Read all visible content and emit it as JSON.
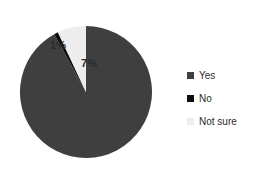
{
  "chart_data": {
    "type": "pie",
    "title": "",
    "subtitle": "",
    "xlabel": "",
    "ylabel": "",
    "grid": false,
    "legend_position": "right",
    "start_angle_deg": 0,
    "direction": "clockwise",
    "categories": [
      "Yes",
      "No",
      "Not sure"
    ],
    "values": [
      92,
      1,
      7
    ],
    "value_unit": "%",
    "data_labels": [
      "92%",
      "1%",
      "7%"
    ],
    "colors": [
      "#3f3f3f",
      "#0d0d0d",
      "#ededed"
    ],
    "slices": [
      {
        "label": "Yes",
        "value": 92,
        "data_label": "92%",
        "color": "#3f3f3f",
        "label_placement": "inside"
      },
      {
        "label": "No",
        "value": 1,
        "data_label": "1%",
        "color": "#0d0d0d",
        "label_placement": "outside"
      },
      {
        "label": "Not sure",
        "value": 7,
        "data_label": "7%",
        "color": "#ededed",
        "label_placement": "inside"
      }
    ]
  },
  "legend": {
    "items": [
      {
        "label": "Yes",
        "color": "#3f3f3f",
        "marker": "square-marker"
      },
      {
        "label": "No",
        "color": "#0d0d0d",
        "marker": "square-marker"
      },
      {
        "label": "Not sure",
        "color": "#ededed",
        "marker": "square-marker"
      }
    ]
  },
  "canvas": {
    "background": "#ffffff"
  }
}
